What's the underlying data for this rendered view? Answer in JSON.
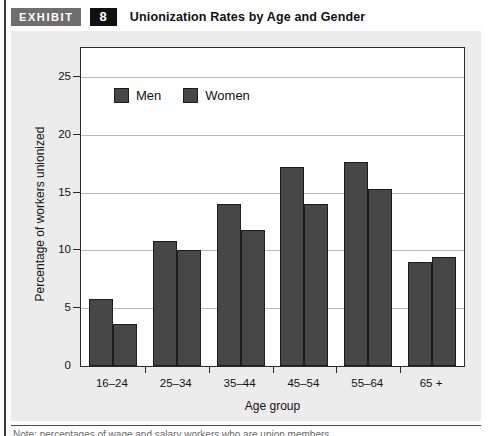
{
  "exhibit": {
    "tag_label": "EXHIBIT",
    "number": "8",
    "title": "Unionization Rates by Age and Gender"
  },
  "colors": {
    "bar_fill": "#474747",
    "bar_stroke": "#1d1d1d",
    "plate_background": "#ececec",
    "gridline": "#b9b9b9",
    "axis": "#2b2b2b",
    "tag_background": "#6e6e6e",
    "number_background": "#111111"
  },
  "chart_data": {
    "type": "bar",
    "title": "Unionization Rates by Age and Gender",
    "xlabel": "Age group",
    "ylabel": "Percentage of workers unionized",
    "categories": [
      "16–24",
      "25–34",
      "35–44",
      "45–54",
      "55–64",
      "65 +"
    ],
    "series": [
      {
        "name": "Men",
        "values": [
          5.8,
          10.8,
          14.0,
          17.2,
          17.6,
          9.0
        ]
      },
      {
        "name": "Women",
        "values": [
          3.6,
          10.0,
          11.8,
          14.0,
          15.3,
          9.4
        ]
      }
    ],
    "ylim": [
      0,
      27.5
    ],
    "yticks": [
      0,
      5,
      10,
      15,
      20,
      25
    ],
    "ytick_labels": [
      "0",
      "5",
      "10",
      "15",
      "20",
      "25"
    ],
    "grid": true,
    "legend_position": "upper-left"
  },
  "caption": {
    "clipped_line": "Note: percentages of wage and salary workers who are union members"
  }
}
